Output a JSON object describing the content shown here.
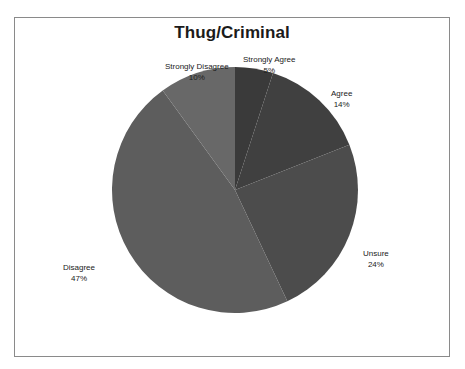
{
  "chart_data": {
    "type": "pie",
    "title": "Thug/Criminal",
    "xlabel": "",
    "ylabel": "",
    "legend_position": "none",
    "grid": false,
    "labels_outside": true,
    "categories": [
      "Strongly Agree",
      "Agree",
      "Unsure",
      "Disagree",
      "Strongly Disagree"
    ],
    "values": [
      5,
      14,
      24,
      47,
      10
    ],
    "value_unit": "%",
    "start_angle_deg": 0,
    "direction": "clockwise",
    "slices": [
      {
        "label": "Strongly Agree",
        "value": 5,
        "display_value": "5%",
        "color": "#3a3a3a",
        "start_deg": 0,
        "end_deg": 18
      },
      {
        "label": "Agree",
        "value": 14,
        "display_value": "14%",
        "color": "#404040",
        "start_deg": 18,
        "end_deg": 68.4
      },
      {
        "label": "Unsure",
        "value": 24,
        "display_value": "24%",
        "color": "#4c4c4c",
        "start_deg": 68.4,
        "end_deg": 154.8
      },
      {
        "label": "Disagree",
        "value": 47,
        "display_value": "47%",
        "color": "#5d5d5d",
        "start_deg": 154.8,
        "end_deg": 324
      },
      {
        "label": "Strongly Disagree",
        "value": 10,
        "display_value": "10%",
        "color": "#686868",
        "start_deg": 324,
        "end_deg": 360
      }
    ]
  },
  "frame": {
    "border_color": "#8a8a8a",
    "background_color": "#ffffff"
  }
}
